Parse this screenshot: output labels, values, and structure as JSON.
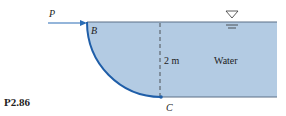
{
  "figure": {
    "problem_label": "P2.86",
    "force_label": "P",
    "point_top_label": "B",
    "point_bottom_label": "C",
    "depth_label": "2 m",
    "fluid_label": "Water"
  },
  "colors": {
    "water_fill": "#b3cbe3",
    "gate_stroke": "#1f5ea8",
    "surface_line": "#5a6f86",
    "arrow": "#2a6db5"
  }
}
